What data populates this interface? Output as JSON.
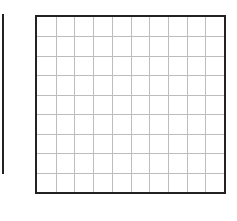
{
  "diagram": {
    "type": "blank-grid",
    "side_line": {
      "x": 2,
      "y_start": 14,
      "y_end": 174,
      "width": 2,
      "color": "#222222"
    },
    "grid": {
      "x": 35,
      "y": 15,
      "width": 191,
      "height": 179,
      "columns": 10,
      "rows": 9,
      "border_color": "#222222",
      "line_color": "#bdbdbd",
      "background": "#ffffff"
    }
  }
}
